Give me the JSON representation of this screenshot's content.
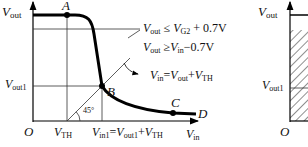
{
  "left_diagram": {
    "y_axis_label": "V",
    "y_axis_sub": "out",
    "x_axis_label": "V",
    "x_axis_sub": "in",
    "origin": "O",
    "points": {
      "A": "A",
      "B": "B",
      "C": "C",
      "D": "D"
    },
    "vout1": {
      "main": "V",
      "sub": "out1"
    },
    "vth": {
      "main": "V",
      "sub": "TH"
    },
    "vin1": {
      "p1": "V",
      "s1": "in1",
      "eq": "=",
      "p2": "V",
      "s2": "out1",
      "plus": "+",
      "p3": "V",
      "s3": "TH"
    },
    "angle": "45°",
    "cond1": {
      "p1": "V",
      "s1": "out",
      "op": " ≤ ",
      "p2": "V",
      "s2": "G2",
      "rest": " + 0.7V"
    },
    "cond2": {
      "p1": "V",
      "s1": "out",
      "op": " ≥",
      "p2": "V",
      "s2": "in",
      "rest": "−0.7V"
    },
    "cond3": {
      "p1": "V",
      "s1": "in",
      "eq": "=",
      "p2": "V",
      "s2": "out",
      "plus": "+",
      "p3": "V",
      "s3": "TH"
    }
  },
  "right_diagram": {
    "y_axis_label": "V",
    "y_axis_sub": "out",
    "vout1": {
      "main": "V",
      "sub": "out1"
    },
    "origin": "O"
  },
  "colors": {
    "line": "#000000",
    "thin": "#333333"
  }
}
